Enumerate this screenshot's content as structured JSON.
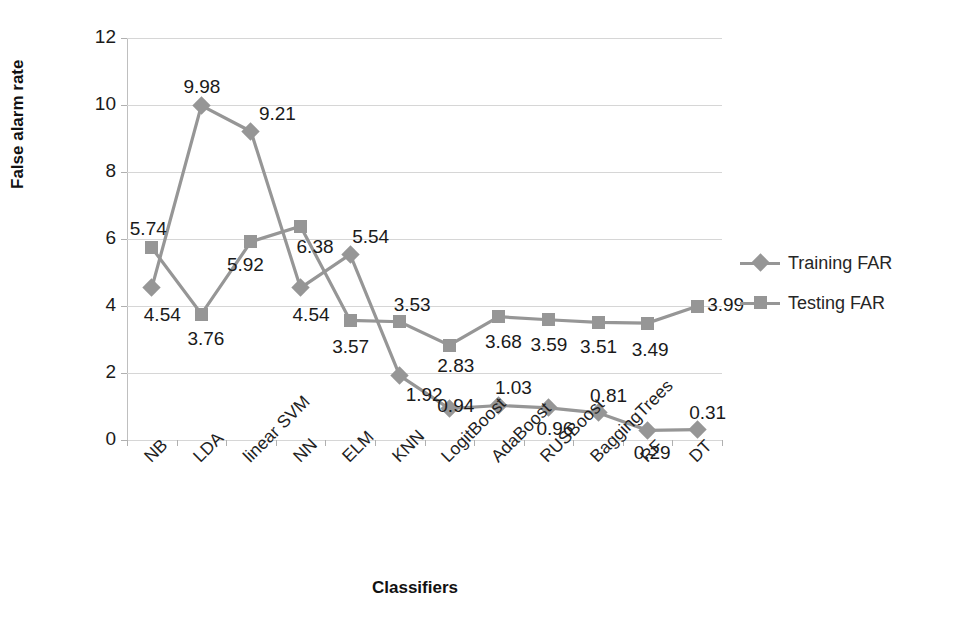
{
  "chart_data": {
    "type": "line",
    "title": "",
    "xlabel": "Classifiers",
    "ylabel": "False alarm rate",
    "categories": [
      "NB",
      "LDA",
      "linear SVM",
      "NN",
      "ELM",
      "KNN",
      "LogitBoost",
      "AdaBoost",
      "RUSBoost",
      "BaggingTrees",
      "RF",
      "DT"
    ],
    "ylim": [
      0,
      12
    ],
    "yticks": [
      0,
      2,
      4,
      6,
      8,
      10,
      12
    ],
    "ytick_labels": [
      "0",
      "2",
      "4",
      "6",
      "8",
      "10",
      "12"
    ],
    "grid": true,
    "legend_position": "right",
    "series": [
      {
        "name": "Training FAR",
        "marker": "diamond",
        "color": "#969696",
        "values": [
          4.54,
          9.98,
          9.21,
          4.54,
          5.54,
          1.92,
          0.94,
          1.03,
          0.96,
          0.81,
          0.29,
          0.31
        ],
        "labels": [
          "4.54",
          "9.98",
          "9.21",
          "4.54",
          "5.54",
          "1.92",
          "0.94",
          "1.03",
          "0.96",
          "0.81",
          "0.29",
          "0.31"
        ]
      },
      {
        "name": "Testing FAR",
        "marker": "square",
        "color": "#969696",
        "values": [
          5.74,
          3.76,
          5.92,
          6.38,
          3.57,
          3.53,
          2.83,
          3.68,
          3.59,
          3.51,
          3.49,
          3.99
        ],
        "labels": [
          "5.74",
          "3.76",
          "5.92",
          "6.38",
          "3.57",
          "3.53",
          "2.83",
          "3.68",
          "3.59",
          "3.51",
          "3.49",
          "3.99"
        ]
      }
    ]
  },
  "legend": {
    "entries": [
      {
        "label": "Training FAR",
        "marker": "diamond",
        "color": "#969696"
      },
      {
        "label": "Testing FAR",
        "marker": "square",
        "color": "#969696"
      }
    ]
  },
  "colors": {
    "series": "#969696",
    "gridline": "#d6d6d6",
    "text": "#1a1a1a",
    "background": "#ffffff"
  },
  "label_offsets": {
    "Training FAR": [
      {
        "dx": -8,
        "dy": 16
      },
      {
        "dx": -18,
        "dy": -30
      },
      {
        "dx": 8,
        "dy": -28
      },
      {
        "dx": -8,
        "dy": 16
      },
      {
        "dx": 2,
        "dy": -28
      },
      {
        "dx": 6,
        "dy": 8
      },
      {
        "dx": -12,
        "dy": -14
      },
      {
        "dx": -4,
        "dy": -28
      },
      {
        "dx": -12,
        "dy": 10
      },
      {
        "dx": -8,
        "dy": -28
      },
      {
        "dx": -14,
        "dy": 12
      },
      {
        "dx": -8,
        "dy": -28
      }
    ],
    "Testing FAR": [
      {
        "dx": -22,
        "dy": -30
      },
      {
        "dx": -14,
        "dy": 14
      },
      {
        "dx": -24,
        "dy": 12
      },
      {
        "dx": -4,
        "dy": 10
      },
      {
        "dx": -18,
        "dy": 16
      },
      {
        "dx": -6,
        "dy": -28
      },
      {
        "dx": -12,
        "dy": 10
      },
      {
        "dx": -14,
        "dy": 14
      },
      {
        "dx": -18,
        "dy": 14
      },
      {
        "dx": -18,
        "dy": 14
      },
      {
        "dx": -16,
        "dy": 16
      },
      {
        "dx": 10,
        "dy": -12
      }
    ]
  }
}
